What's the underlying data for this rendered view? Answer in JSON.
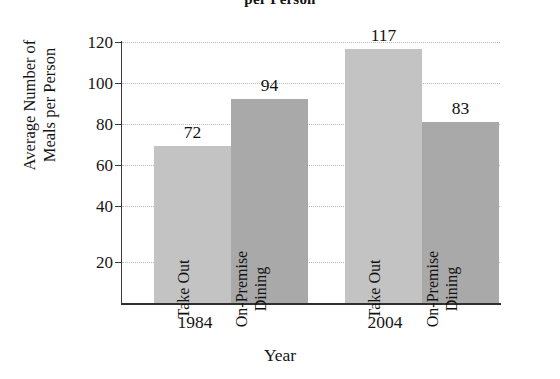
{
  "chart_data": {
    "type": "bar",
    "title": "per Person",
    "title_note": "title is clipped at the top edge of the screenshot",
    "xlabel": "Year",
    "ylabel": "Average Number of Meals per Person",
    "ylabel_line1": "Average Number of",
    "ylabel_line2": "Meals per Person",
    "categories": [
      "1984",
      "2004"
    ],
    "series": [
      {
        "name": "Take Out",
        "values": [
          72,
          117
        ],
        "color": "#c3c3c3"
      },
      {
        "name": "On-Premise Dining",
        "values": [
          94,
          83
        ],
        "color": "#a9a9a9"
      }
    ],
    "bars": [
      {
        "group": "1984",
        "label": "Take Out",
        "label_line1": "Take Out",
        "label_line2": "",
        "value": 72,
        "value_text": "72",
        "color": "#c3c3c3"
      },
      {
        "group": "1984",
        "label": "On-Premise Dining",
        "label_line1": "On-Premise",
        "label_line2": "Dining",
        "value": 94,
        "value_text": "94",
        "color": "#a9a9a9"
      },
      {
        "group": "2004",
        "label": "Take Out",
        "label_line1": "Take Out",
        "label_line2": "",
        "value": 117,
        "value_text": "117",
        "color": "#c3c3c3"
      },
      {
        "group": "2004",
        "label": "On-Premise Dining",
        "label_line1": "On-Premise",
        "label_line2": "Dining",
        "value": 83,
        "value_text": "83",
        "color": "#a9a9a9"
      }
    ],
    "yticks": [
      20,
      40,
      60,
      80,
      100,
      120
    ],
    "ytick_labels": [
      "20",
      "40",
      "60",
      "80",
      "100",
      "120"
    ],
    "ylim": [
      0,
      120
    ],
    "xtick_labels": [
      "1984",
      "2004"
    ],
    "grid": true,
    "grid_style": "dotted",
    "legend": "none",
    "axis_color": "#2f2f2f",
    "grid_color": "#b9b9b9",
    "text_color": "#141414",
    "background": "#ffffff"
  }
}
